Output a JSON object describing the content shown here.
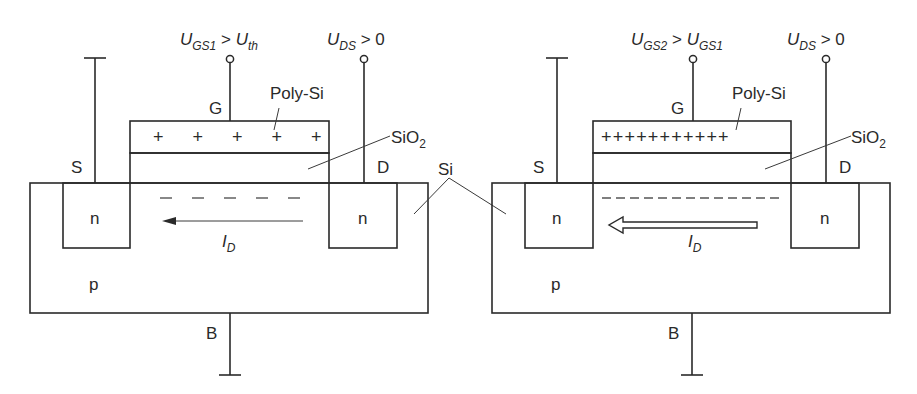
{
  "figure": {
    "type": "MOSFET cross-section comparison",
    "left": {
      "gate_voltage_label": {
        "main": "U",
        "sub": "GS1",
        "rel": " > ",
        "main2": "U",
        "sub2": "th"
      },
      "drain_voltage_label": {
        "main": "U",
        "sub": "DS",
        "rel": " > 0"
      },
      "gate_terminal": "G",
      "source_terminal": "S",
      "drain_terminal": "D",
      "bulk_terminal": "B",
      "gate_material": "Poly-Si",
      "oxide_label": {
        "main": "SiO",
        "sub": "2"
      },
      "source_region": "n",
      "drain_region": "n",
      "substrate": "p",
      "gate_charges": "+ + + + +",
      "current_label": {
        "main": "I",
        "sub": "D"
      }
    },
    "right": {
      "gate_voltage_label": {
        "main": "U",
        "sub": "GS2",
        "rel": " > ",
        "main2": "U",
        "sub2": "GS1"
      },
      "drain_voltage_label": {
        "main": "U",
        "sub": "DS",
        "rel": " > 0"
      },
      "gate_terminal": "G",
      "source_terminal": "S",
      "drain_terminal": "D",
      "bulk_terminal": "B",
      "gate_material": "Poly-Si",
      "oxide_label": {
        "main": "SiO",
        "sub": "2"
      },
      "source_region": "n",
      "drain_region": "n",
      "substrate": "p",
      "gate_charges": "+++++++++++",
      "current_label": {
        "main": "I",
        "sub": "D"
      }
    },
    "shared_label": "Si",
    "colors": {
      "line": "#2a2a2a",
      "poly_fill": "#cfcfcf",
      "background": "#ffffff"
    }
  }
}
